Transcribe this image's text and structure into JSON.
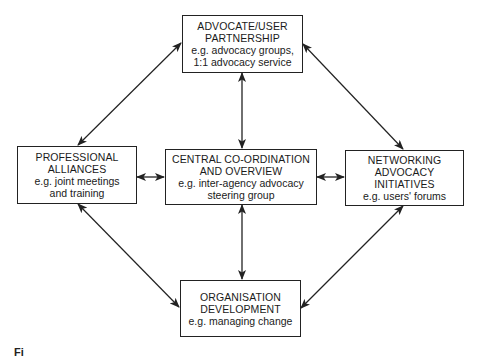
{
  "diagram": {
    "nodes": [
      {
        "id": "top",
        "title": [
          "ADVOCATE/USER",
          "PARTNERSHIP"
        ],
        "example": [
          "e.g. advocacy groups,",
          "1:1 advocacy service"
        ]
      },
      {
        "id": "left",
        "title": [
          "PROFESSIONAL",
          "ALLIANCES"
        ],
        "example": [
          "e.g. joint meetings",
          "and training"
        ]
      },
      {
        "id": "center",
        "title": [
          "CENTRAL CO-ORDINATION",
          "AND OVERVIEW"
        ],
        "example": [
          "e.g. inter-agency advocacy",
          "steering group"
        ]
      },
      {
        "id": "right",
        "title": [
          "NETWORKING",
          "ADVOCACY",
          "INITIATIVES"
        ],
        "example": [
          "e.g. users' forums"
        ]
      },
      {
        "id": "bottom",
        "title": [
          "ORGANISATION",
          "DEVELOPMENT"
        ],
        "example": [
          "e.g. managing change"
        ]
      }
    ],
    "edges": [
      {
        "from": "top",
        "to": "left",
        "type": "bidirectional"
      },
      {
        "from": "top",
        "to": "right",
        "type": "bidirectional"
      },
      {
        "from": "top",
        "to": "center",
        "type": "bidirectional"
      },
      {
        "from": "left",
        "to": "center",
        "type": "bidirectional"
      },
      {
        "from": "center",
        "to": "right",
        "type": "bidirectional"
      },
      {
        "from": "center",
        "to": "bottom",
        "type": "bidirectional"
      },
      {
        "from": "left",
        "to": "bottom",
        "type": "bidirectional"
      },
      {
        "from": "right",
        "to": "bottom",
        "type": "bidirectional"
      }
    ]
  },
  "top": {
    "t1": "ADVOCATE/USER",
    "t2": "PARTNERSHIP",
    "e1": "e.g. advocacy groups,",
    "e2": "1:1 advocacy service"
  },
  "left": {
    "t1": "PROFESSIONAL",
    "t2": "ALLIANCES",
    "e1": "e.g. joint meetings",
    "e2": "and training"
  },
  "center": {
    "t1": "CENTRAL CO-ORDINATION",
    "t2": "AND OVERVIEW",
    "e1": "e.g. inter-agency advocacy",
    "e2": "steering group"
  },
  "right": {
    "t1": "NETWORKING",
    "t2": "ADVOCACY",
    "t3": "INITIATIVES",
    "e1": "e.g. users' forums"
  },
  "bottom": {
    "t1": "ORGANISATION",
    "t2": "DEVELOPMENT",
    "e1": "e.g. managing change"
  },
  "caption": {
    "text": "Fi"
  }
}
